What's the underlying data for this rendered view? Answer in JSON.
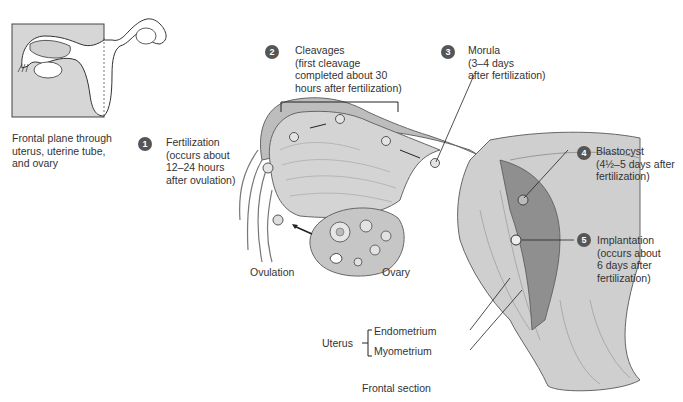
{
  "inset": {
    "caption_lines": [
      "Frontal plane through",
      "uterus, uterine tube,",
      "and ovary"
    ]
  },
  "steps": [
    {
      "number": "1",
      "lines": [
        "Fertilization",
        "(occurs about",
        "12–24 hours",
        "after ovulation)"
      ]
    },
    {
      "number": "2",
      "lines": [
        "Cleavages",
        "(first cleavage",
        "completed about 30",
        "hours after fertilization)"
      ]
    },
    {
      "number": "3",
      "lines": [
        "Morula",
        "(3–4 days",
        "after fertilization)"
      ]
    },
    {
      "number": "4",
      "lines": [
        "Blastocyst",
        "(4½–5 days after",
        "fertilization)"
      ]
    },
    {
      "number": "5",
      "lines": [
        "Implantation",
        "(occurs about",
        "6 days after",
        "fertilization)"
      ]
    }
  ],
  "labels": {
    "ovulation": "Ovulation",
    "ovary": "Ovary",
    "uterus": "Uterus",
    "endometrium": "Endometrium",
    "myometrium": "Myometrium",
    "section": "Frontal section"
  },
  "colors": {
    "badge": "#555555",
    "tissue": "#c9c9c9",
    "tissue_dark": "#9a9a9a",
    "inset_fill": "#d6d6d6"
  }
}
